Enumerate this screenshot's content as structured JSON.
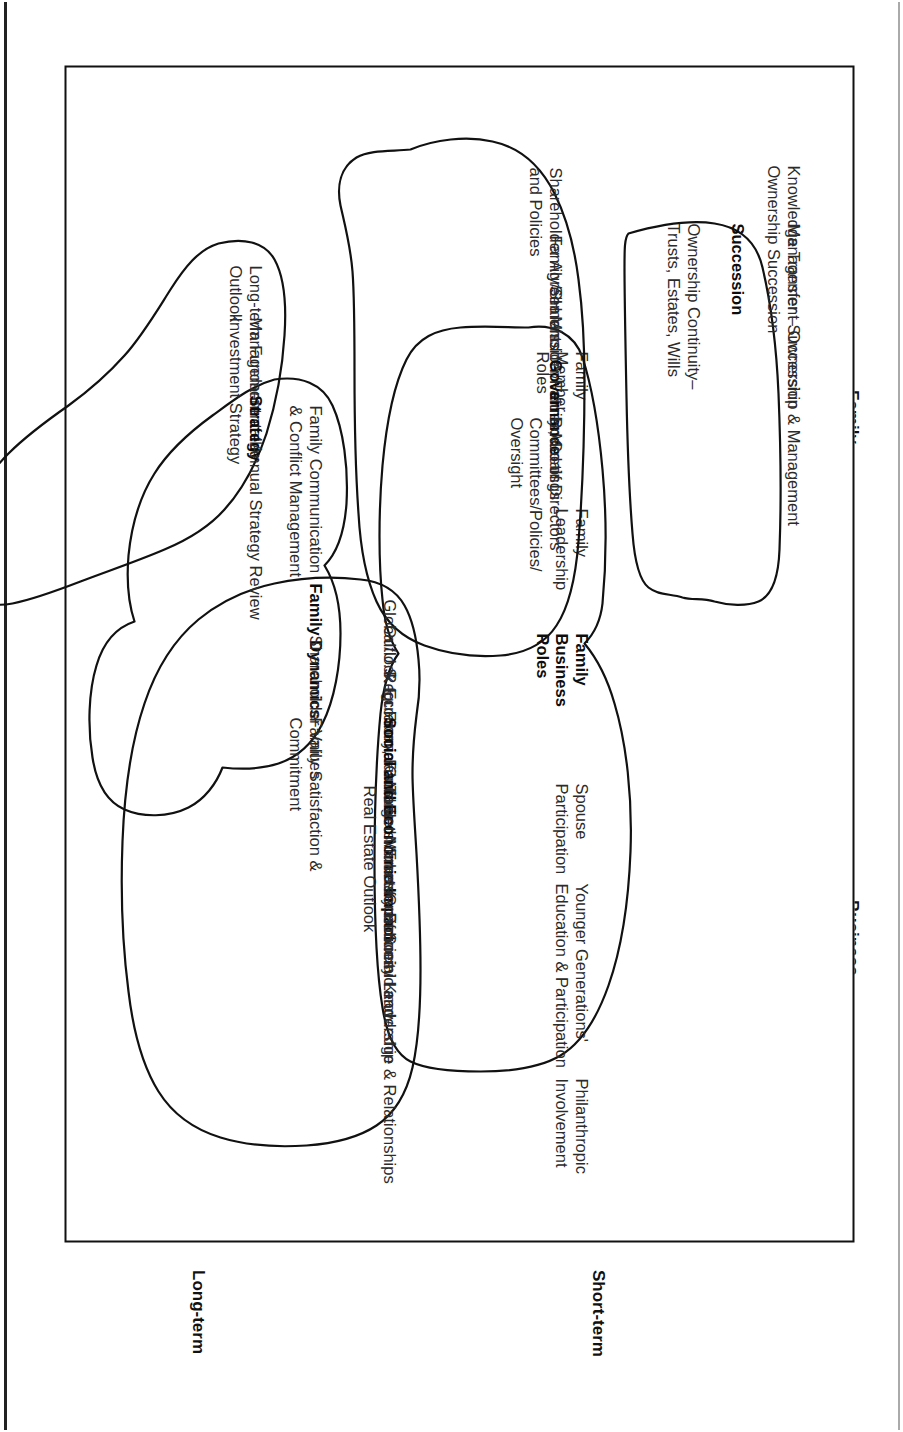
{
  "diagram": {
    "type": "quadrant-map",
    "axes": {
      "vertical": {
        "top_label": "Family",
        "bottom_label": "Business"
      },
      "horizontal": {
        "left_label": "Long-term",
        "right_label": "Short-term"
      }
    },
    "clusters": [
      {
        "id": "succession",
        "heading": "Succession",
        "quadrant": "Family / Long-term",
        "items": [
          "Knowledge Transfer – Ownership & Management",
          "Ownership Succession",
          "Management Succession",
          "Ownership Continuity–",
          "Trusts, Estates, Wills"
        ]
      },
      {
        "id": "family-business-roles",
        "heading": "Family\nBusiness\nRoles",
        "heading_lines": [
          "Family",
          "Business",
          "Roles"
        ],
        "quadrant": "Family / Long-term",
        "items": [
          "Family Member Roles",
          "Family Leadership",
          "Spouse Participation",
          "Younger Generations' Education & Participation",
          "Philanthropic Involvement"
        ]
      },
      {
        "id": "family-dynamics",
        "heading": "Family Dynamics",
        "quadrant": "Family / Short-term",
        "items": [
          "Family Communication & Conflict Management",
          "Shareholder Values",
          "Family Satisfaction & Commitment"
        ]
      },
      {
        "id": "governance",
        "heading": "Governance",
        "quadrant": "Family-Business / Long-term",
        "items": [
          "Shareholder Agreements and Policies",
          "Family/SH Mission, Values, Goals",
          "Shareholder/Family Meetings",
          "Board of Directors Committees/Policies/Oversight"
        ]
      },
      {
        "id": "social-and-economic-impact",
        "heading": "Social and Economic Impact",
        "quadrant": "Business / Short-term",
        "items": [
          "Global/U.S. Economic Outlook",
          "Outlook for Financial Markets",
          "Regulatory, Fiscal and Monetary Policies",
          "Target Markets – Economic and Real Estate Outlook",
          "Transfer of Social Knowledge & Relationships",
          "Community Leadership"
        ]
      },
      {
        "id": "strategy",
        "heading": "Strategy",
        "quadrant": "Business / Long-term",
        "items": [
          "Long-term Fundamental Outlook",
          "Management of the Investment Strategy",
          "Annual Strategy Review"
        ]
      },
      {
        "id": "performance",
        "heading": "Performance",
        "quadrant": "Business / Short-term",
        "items": [
          "Annual Plan",
          "Major Objectives",
          "Financial Performance",
          "Performance Analysis"
        ]
      }
    ]
  },
  "succession": {
    "heading": "Succession",
    "l1a": "Knowledge Transfer – Ownership & Management",
    "l1b": "Ownership Succession",
    "l2": "Management Succession",
    "l3a": "Ownership Continuity–",
    "l3b": "Trusts, Estates, Wills"
  },
  "roles": {
    "h1": "Family",
    "h2": "Business",
    "h3": "Roles",
    "l1a": "Family",
    "l1b": "Member",
    "l1c": "Roles",
    "l2a": "Family",
    "l2b": "Leadership",
    "l3a": "Spouse",
    "l3b": "Participation",
    "l4a": "Younger Generations'",
    "l4b": "Education & Participation",
    "l5a": "Philanthropic",
    "l5b": "Involvement"
  },
  "dynamics": {
    "heading": "Family Dynamics",
    "l1a": "Family Communication",
    "l1b": "& Conflict Management",
    "l2": "Shareholder Values",
    "l3a": "Family Satisfaction &",
    "l3b": "Commitment"
  },
  "governance": {
    "heading": "Governance",
    "l1a": "Shareholder Agreements",
    "l1b": "and Policies",
    "l2": "Family/SH Mission, Values, Goals",
    "l3": "Shareholder/Family Meetings",
    "l4a": "Board of Directors",
    "l4b": "Committees/Policies/",
    "l4c": "Oversight"
  },
  "social": {
    "heading": "Social and Economic Impact",
    "l1": "Global/U.S. Economic Outlook",
    "l2": "Outlook for Financial Markets",
    "l3": "Regulatory, Fiscal and Monetary Policies",
    "l4a": "Target Markets – Economic and",
    "l4b": "Real Estate Outlook",
    "l5": "Transfer of Social Knowledge & Relationships",
    "l6": "Community Leadership"
  },
  "strategy": {
    "heading": "Strategy",
    "l1a": "Long-term Fundamental",
    "l1b": "Outlook",
    "l2a": "Management of the",
    "l2b": "Investment Strategy",
    "l3": "Annual Strategy Review"
  },
  "performance": {
    "heading": "Performance",
    "l1": "Annual Plan",
    "l2": "Major Objectives",
    "l3": "Financial Performance",
    "l4": "Performance Analysis"
  },
  "axis": {
    "family": "Family",
    "business": "Business",
    "longterm": "Long-term",
    "shortterm": "Short-term"
  },
  "colors": {
    "ink": "#1a1a1a",
    "blob_stroke": "#111111",
    "frame": "#111111",
    "background": "#ffffff"
  }
}
